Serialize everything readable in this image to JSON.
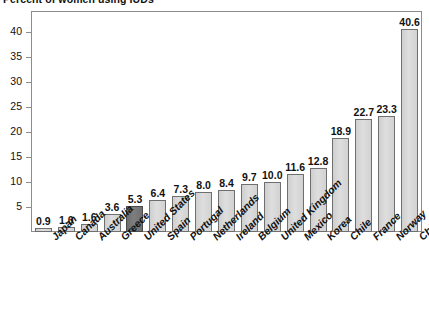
{
  "chart_data": {
    "type": "bar",
    "title": "Percent of women using IUDs",
    "xlabel": "",
    "ylabel": "",
    "ylim": [
      0,
      44
    ],
    "yticks": [
      5,
      10,
      15,
      20,
      25,
      30,
      35,
      40
    ],
    "grid": false,
    "legend": "none",
    "value_labels": true,
    "highlight_category": "United States",
    "highlight_color": "#767676",
    "bar_color": "#d6d6d6",
    "bar_border_color": "#6f6f6f",
    "categories": [
      "Japan",
      "Canada",
      "Australia",
      "Greece",
      "United States",
      "Spain",
      "Portugal",
      "Netherlands",
      "Ireland",
      "Belgium",
      "United Kingdom",
      "Mexico",
      "Korea",
      "Chile",
      "France",
      "Norway",
      "China"
    ],
    "values": [
      0.9,
      1.0,
      1.6,
      3.6,
      5.3,
      6.4,
      7.3,
      8.0,
      8.4,
      9.7,
      10.0,
      11.6,
      12.8,
      18.9,
      22.7,
      23.3,
      40.6
    ],
    "value_label_text": [
      "0.9",
      "1.0",
      "1.6",
      "3.6",
      "5.3",
      "6.4",
      "7.3",
      "8.0",
      "8.4",
      "9.7",
      "10.0",
      "11.6",
      "12.8",
      "18.9",
      "22.7",
      "23.3",
      "40.6"
    ],
    "ytick_labels": [
      "5",
      "10",
      "15",
      "20",
      "25",
      "30",
      "35",
      "40"
    ]
  }
}
